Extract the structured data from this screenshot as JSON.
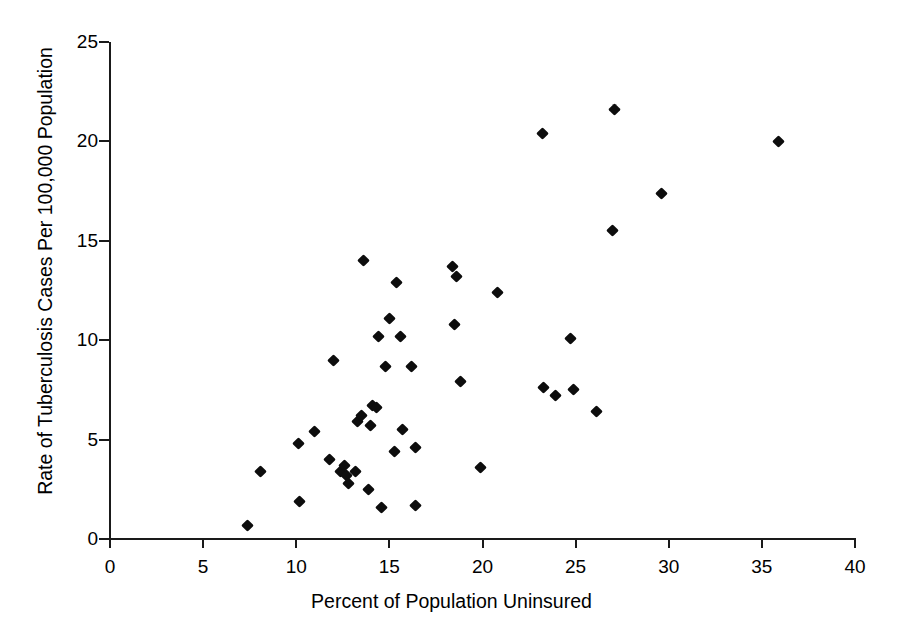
{
  "chart_data": {
    "type": "scatter",
    "title": "",
    "xlabel": "Percent of Population Uninsured",
    "ylabel": "Rate of Tuberculosis Cases Per 100,000 Population",
    "xlim": [
      0,
      40
    ],
    "ylim": [
      0,
      25
    ],
    "xticks": [
      0,
      5,
      10,
      15,
      20,
      25,
      30,
      35,
      40
    ],
    "yticks": [
      0,
      5,
      10,
      15,
      20,
      25
    ],
    "xtick_labels": [
      "0",
      "5",
      "10",
      "15",
      "20",
      "25",
      "30",
      "35",
      "40"
    ],
    "ytick_labels": [
      "0",
      "5",
      "10",
      "15",
      "20",
      "25"
    ],
    "grid": false,
    "legend": null,
    "marker": "diamond",
    "marker_color": "#0d0d0d",
    "point_count": 51,
    "points": [
      {
        "x": 7.4,
        "y": 0.7
      },
      {
        "x": 8.1,
        "y": 3.4
      },
      {
        "x": 10.2,
        "y": 1.9
      },
      {
        "x": 10.1,
        "y": 4.8
      },
      {
        "x": 11.0,
        "y": 5.4
      },
      {
        "x": 11.8,
        "y": 4.0
      },
      {
        "x": 12.0,
        "y": 9.0
      },
      {
        "x": 12.4,
        "y": 3.4
      },
      {
        "x": 12.6,
        "y": 3.7
      },
      {
        "x": 12.7,
        "y": 3.2
      },
      {
        "x": 12.8,
        "y": 2.8
      },
      {
        "x": 13.2,
        "y": 3.4
      },
      {
        "x": 13.3,
        "y": 5.9
      },
      {
        "x": 13.5,
        "y": 6.2
      },
      {
        "x": 13.6,
        "y": 14.0
      },
      {
        "x": 13.9,
        "y": 2.5
      },
      {
        "x": 14.0,
        "y": 5.7
      },
      {
        "x": 14.1,
        "y": 6.7
      },
      {
        "x": 14.3,
        "y": 6.6
      },
      {
        "x": 14.4,
        "y": 10.2
      },
      {
        "x": 14.6,
        "y": 1.6
      },
      {
        "x": 14.8,
        "y": 8.7
      },
      {
        "x": 15.0,
        "y": 11.1
      },
      {
        "x": 15.3,
        "y": 4.4
      },
      {
        "x": 15.4,
        "y": 12.9
      },
      {
        "x": 15.6,
        "y": 10.2
      },
      {
        "x": 15.7,
        "y": 5.5
      },
      {
        "x": 16.2,
        "y": 8.7
      },
      {
        "x": 16.4,
        "y": 1.7
      },
      {
        "x": 16.4,
        "y": 4.6
      },
      {
        "x": 18.4,
        "y": 13.7
      },
      {
        "x": 18.6,
        "y": 13.2
      },
      {
        "x": 18.5,
        "y": 10.8
      },
      {
        "x": 18.8,
        "y": 7.9
      },
      {
        "x": 19.9,
        "y": 3.6
      },
      {
        "x": 20.8,
        "y": 12.4
      },
      {
        "x": 23.2,
        "y": 20.4
      },
      {
        "x": 23.3,
        "y": 7.6
      },
      {
        "x": 23.9,
        "y": 7.2
      },
      {
        "x": 24.7,
        "y": 10.1
      },
      {
        "x": 24.9,
        "y": 7.5
      },
      {
        "x": 26.1,
        "y": 6.4
      },
      {
        "x": 27.0,
        "y": 15.5
      },
      {
        "x": 27.1,
        "y": 21.6
      },
      {
        "x": 29.6,
        "y": 17.4
      },
      {
        "x": 35.9,
        "y": 20.0
      }
    ]
  },
  "axes": {
    "y_title": "Rate of Tuberculosis Cases Per 100,000 Population",
    "x_title": "Percent of Population Uninsured"
  }
}
